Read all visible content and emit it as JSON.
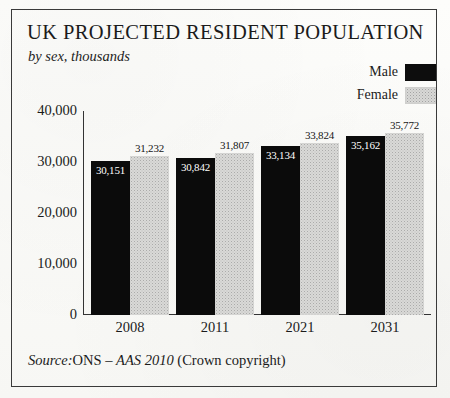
{
  "figure": {
    "title": "UK PROJECTED RESIDENT POPULATION",
    "subtitle": "by sex, thousands",
    "source": {
      "prefix": "Source:",
      "body": "ONS – ",
      "italic_ref": "AAS 2010",
      "suffix": " (Crown copyright)"
    }
  },
  "legend": {
    "items": [
      {
        "label": "Male",
        "swatch": "solid-black",
        "color": "#0b0b0b"
      },
      {
        "label": "Female",
        "swatch": "stippled-grey",
        "color": "#d9d9d7"
      }
    ]
  },
  "axis": {
    "y_ticks": [
      "40,000",
      "30,000",
      "20,000",
      "10,000",
      "0"
    ],
    "y_tick_values": [
      40000,
      30000,
      20000,
      10000,
      0
    ],
    "x_labels": [
      "2008",
      "2011",
      "2021",
      "2031"
    ]
  },
  "chart_data": {
    "type": "bar",
    "title": "UK PROJECTED RESIDENT POPULATION",
    "subtitle": "by sex, thousands",
    "xlabel": "",
    "ylabel": "thousands",
    "ylim": [
      0,
      40000
    ],
    "yticks": [
      0,
      10000,
      20000,
      30000,
      40000
    ],
    "grid": false,
    "legend_position": "top-right",
    "categories": [
      "2008",
      "2011",
      "2021",
      "2031"
    ],
    "series": [
      {
        "name": "Male",
        "color": "#0b0b0b",
        "values": [
          30151,
          30842,
          33134,
          35162
        ],
        "labels": [
          "30,151",
          "30,842",
          "33,134",
          "35,162"
        ]
      },
      {
        "name": "Female",
        "color": "#d9d9d7",
        "values": [
          31232,
          31807,
          33824,
          35772
        ],
        "labels": [
          "31,232",
          "31,807",
          "33,824",
          "35,772"
        ]
      }
    ],
    "source": "Source: ONS – AAS 2010 (Crown copyright)"
  }
}
